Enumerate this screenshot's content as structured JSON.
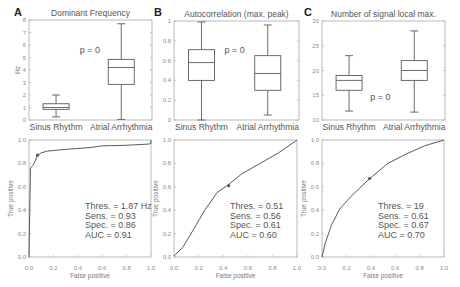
{
  "figure": {
    "panels": [
      "A",
      "B",
      "C"
    ]
  },
  "chart_data": [
    {
      "type": "box",
      "panel": "A",
      "title": "Dominant Frequency",
      "xlabel": "",
      "ylabel": "Hz",
      "categories": [
        "Sinus Rhythm",
        "Atrial Arrhythmia"
      ],
      "ylim": [
        0,
        8
      ],
      "yticks": [
        0,
        1,
        2,
        3,
        4,
        5,
        6,
        7,
        8
      ],
      "ytick_labels": [
        "0",
        "1",
        "2",
        "3",
        "4",
        "5",
        "6",
        "7",
        "8"
      ],
      "series": [
        {
          "name": "Sinus Rhythm",
          "whisker_low": 0.25,
          "q1": 0.85,
          "median": 1.0,
          "q3": 1.3,
          "whisker_high": 2.0
        },
        {
          "name": "Atrial Arrhythmia",
          "whisker_low": 0.05,
          "q1": 2.85,
          "median": 4.2,
          "q3": 4.85,
          "whisker_high": 7.7
        }
      ],
      "annotation": {
        "text": "p = 0",
        "x": 1.52,
        "y": 5.6
      },
      "grid": false
    },
    {
      "type": "box",
      "panel": "B",
      "title": "Autocorrelation (max. peak)",
      "xlabel": "",
      "ylabel": "",
      "categories": [
        "Sinus Rhythm",
        "Atrial Arrhythmia"
      ],
      "ylim": [
        0,
        1
      ],
      "yticks": [
        0,
        0.2,
        0.4,
        0.6,
        0.8,
        1
      ],
      "ytick_labels": [
        "0",
        "0.2",
        "0.4",
        "0.6",
        "0.8",
        "1"
      ],
      "series": [
        {
          "name": "Sinus Rhythm",
          "whisker_low": 0.0,
          "q1": 0.4,
          "median": 0.58,
          "q3": 0.71,
          "whisker_high": 0.99
        },
        {
          "name": "Atrial Arrhythmia",
          "whisker_low": 0.05,
          "q1": 0.3,
          "median": 0.47,
          "q3": 0.65,
          "whisker_high": 0.96
        }
      ],
      "annotation": {
        "text": "p = 0",
        "x": 1.5,
        "y": 0.71
      },
      "grid": false
    },
    {
      "type": "box",
      "panel": "C",
      "title": "Number of signal local max.",
      "xlabel": "",
      "ylabel": "",
      "categories": [
        "Sinus Rhythm",
        "Atrial Arrhythmia"
      ],
      "ylim": [
        10,
        30
      ],
      "yticks": [
        10,
        15,
        20,
        25,
        30
      ],
      "ytick_labels": [
        "10",
        "15",
        "20",
        "25",
        "30"
      ],
      "series": [
        {
          "name": "Sinus Rhythm",
          "whisker_low": 11.8,
          "q1": 16,
          "median": 18,
          "q3": 19,
          "whisker_high": 23
        },
        {
          "name": "Atrial Arrhythmia",
          "whisker_low": 11.6,
          "q1": 18,
          "median": 20,
          "q3": 22,
          "whisker_high": 28
        }
      ],
      "annotation": {
        "text": "p = 0",
        "x": 1.48,
        "y": 14.6
      },
      "grid": false
    },
    {
      "type": "line",
      "panel": "A",
      "title": "",
      "xlabel": "False positive",
      "ylabel": "True positive",
      "xlim": [
        0,
        1
      ],
      "ylim": [
        0,
        1
      ],
      "xticks": [
        0,
        0.2,
        0.4,
        0.6,
        0.8,
        1.0
      ],
      "xtick_labels": [
        "0.0",
        "0.2",
        "0.4",
        "0.6",
        "0.8",
        "1.0"
      ],
      "yticks": [
        0,
        0.2,
        0.4,
        0.6,
        0.8,
        1.0
      ],
      "ytick_labels": [
        "0.0",
        "0.2",
        "0.4",
        "0.6",
        "0.8",
        "1.0"
      ],
      "x": [
        0,
        0.008,
        0.012,
        0.03,
        0.05,
        0.07,
        0.1,
        0.15,
        0.3,
        0.5,
        0.6,
        0.8,
        0.98,
        1.0,
        1.0
      ],
      "y": [
        0,
        0.5,
        0.76,
        0.78,
        0.82,
        0.87,
        0.89,
        0.905,
        0.92,
        0.935,
        0.95,
        0.955,
        0.965,
        0.97,
        1.0
      ],
      "operating_point": {
        "x": 0.07,
        "y": 0.87
      },
      "annotations": [
        "Thres. = 1.87 Hz",
        "Sens. = 0.93",
        "Spec. = 0.86",
        "AUC = 0.91"
      ],
      "grid": false
    },
    {
      "type": "line",
      "panel": "B",
      "title": "",
      "xlabel": "False positive",
      "ylabel": "True positive",
      "xlim": [
        0,
        1
      ],
      "ylim": [
        0,
        1
      ],
      "xticks": [
        0,
        0.2,
        0.4,
        0.6,
        0.8,
        1.0
      ],
      "xtick_labels": [
        "0.0",
        "0.2",
        "0.4",
        "0.6",
        "0.8",
        "1.0"
      ],
      "yticks": [
        0,
        0.2,
        0.4,
        0.6,
        0.8,
        1.0
      ],
      "ytick_labels": [
        "0.0",
        "0.2",
        "0.4",
        "0.6",
        "0.8",
        "1.0"
      ],
      "x": [
        0,
        0.07,
        0.15,
        0.25,
        0.35,
        0.445,
        0.55,
        0.7,
        0.85,
        1.0
      ],
      "y": [
        0.01,
        0.08,
        0.22,
        0.4,
        0.55,
        0.62,
        0.71,
        0.8,
        0.89,
        1.0
      ],
      "operating_point": {
        "x": 0.445,
        "y": 0.61
      },
      "annotations": [
        "Thres. = 0.51",
        "Sens. = 0.56",
        "Spec. = 0.61",
        "AUC = 0.60"
      ],
      "grid": false
    },
    {
      "type": "line",
      "panel": "C",
      "title": "",
      "xlabel": "False positive",
      "ylabel": "True positive",
      "xlim": [
        0,
        1
      ],
      "ylim": [
        0,
        1
      ],
      "xticks": [
        0,
        0.2,
        0.4,
        0.6,
        0.8,
        1.0
      ],
      "xtick_labels": [
        "0.0",
        "0.2",
        "0.4",
        "0.6",
        "0.8",
        "1.0"
      ],
      "yticks": [
        0,
        0.2,
        0.4,
        0.6,
        0.8,
        1.0
      ],
      "ytick_labels": [
        "0.0",
        "0.2",
        "0.4",
        "0.6",
        "0.8",
        "1.0"
      ],
      "x": [
        0,
        0.027,
        0.077,
        0.145,
        0.24,
        0.39,
        0.54,
        0.69,
        0.84,
        1.0
      ],
      "y": [
        0,
        0.12,
        0.27,
        0.41,
        0.52,
        0.67,
        0.8,
        0.88,
        0.95,
        1.0
      ],
      "operating_point": {
        "x": 0.39,
        "y": 0.67
      },
      "annotations": [
        "Thres. = 19",
        "Sens. = 0.61",
        "Spec. = 0.67",
        "AUC = 0.70"
      ],
      "grid": false
    }
  ]
}
